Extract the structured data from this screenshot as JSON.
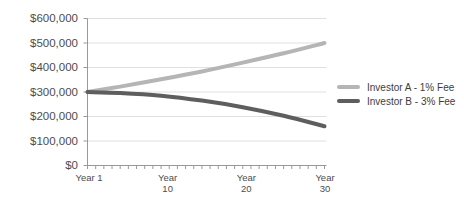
{
  "chart_data": {
    "type": "line",
    "title": "",
    "xlabel": "",
    "ylabel": "",
    "x": [
      1,
      5,
      10,
      15,
      20,
      25,
      30
    ],
    "series": [
      {
        "name": "Investor A - 1% Fee",
        "color": "#b5b5b5",
        "values": [
          300000,
          322000,
          352000,
          384000,
          420000,
          458000,
          500000
        ]
      },
      {
        "name": "Investor B - 3% Fee",
        "color": "#5e5e5e",
        "values": [
          300000,
          296000,
          285000,
          265000,
          238000,
          203000,
          160000
        ]
      }
    ],
    "xlim": [
      1,
      30
    ],
    "ylim": [
      0,
      600000
    ],
    "grid": true,
    "legend_position": "right",
    "y_ticks": [
      {
        "label": "$600,000",
        "value": 600000
      },
      {
        "label": "$500,000",
        "value": 500000
      },
      {
        "label": "$400,000",
        "value": 400000
      },
      {
        "label": "$300,000",
        "value": 300000
      },
      {
        "label": "$200,000",
        "value": 200000
      },
      {
        "label": "$100,000",
        "value": 100000
      },
      {
        "label": "$0",
        "value": 0
      }
    ],
    "x_ticks": [
      {
        "year": 1,
        "lines": [
          "Year 1"
        ]
      },
      {
        "year": 10,
        "lines": [
          "Year",
          "10"
        ]
      },
      {
        "year": 20,
        "lines": [
          "Year",
          "20"
        ]
      },
      {
        "year": 30,
        "lines": [
          "Year",
          "30"
        ]
      }
    ],
    "minor_x_tick_every_year": true
  },
  "colors": {
    "background": "#ffffff",
    "gridline": "#e0e0e0",
    "axis": "#999999",
    "tick": "#999999",
    "axis_text": "#4d4d4d",
    "legend_text": "#3d3d3d"
  }
}
